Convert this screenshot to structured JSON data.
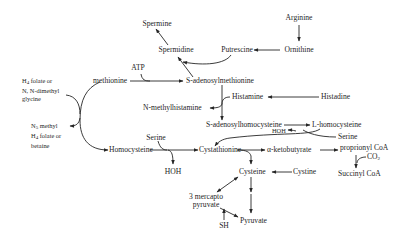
{
  "diagram": {
    "type": "metabolic-pathway",
    "nodes": {
      "arginine": "Arginine",
      "ornithine": "Ornithine",
      "putrescine": "Putrescine",
      "spermidine": "Spermidine",
      "spermine": "Spermine",
      "atp": "ATP",
      "methionine": "methionine",
      "sam": "S-adenosylmethionine",
      "h4folate_l1": "H",
      "h4folate_sub": "4",
      "h4folate_l1b": " folate or",
      "h4folate_l2": "N, N-dimethyl",
      "h4folate_l3": "glycine",
      "n5methyl_l1a": "N",
      "n5methyl_sub": "5",
      "n5methyl_l1b": " methyl",
      "n5methyl_l2a": "H",
      "n5methyl_l2sub": "4",
      "n5methyl_l2b": " folate or",
      "n5methyl_l3": "betaine",
      "n_methylhistamine": "N-methylhistamine",
      "histamine": "Histamine",
      "histadine": "Histadine",
      "sah": "S-adenosylhomocysteine",
      "l_homocysteine": "L-homocysteine",
      "hoh_top": "HOH",
      "serine_right": "Serine",
      "homocysteine": "Homocysteine",
      "serine_left": "Serine",
      "hoh_left": "HOH",
      "cystathionine": "Cystathionine",
      "alpha_ketobutyrate": "α-ketobutyrate",
      "proprionyl_coa": "proprionyl CoA",
      "co2": "CO",
      "co2_sub": "2",
      "succinyl_coa": "Succinyl CoA",
      "cysteine": "Cysteine",
      "cystine": "Cystine",
      "mercapto_l1": "3 mercapto",
      "mercapto_l2": "pyruvate",
      "sh": "SH",
      "pyruvate": "Pyruvate"
    },
    "edges": [
      [
        "Arginine",
        "Ornithine"
      ],
      [
        "Ornithine",
        "Putrescine"
      ],
      [
        "Putrescine",
        "Spermidine"
      ],
      [
        "S-adenosylmethionine",
        "Spermidine"
      ],
      [
        "Spermidine",
        "Spermine"
      ],
      [
        "methionine",
        "S-adenosylmethionine",
        "ATP"
      ],
      [
        "Histadine",
        "Histamine"
      ],
      [
        "S-adenosylmethionine",
        "S-adenosylhomocysteine",
        "Histamine -> N-methylhistamine"
      ],
      [
        "S-adenosylhomocysteine",
        "L-homocysteine"
      ],
      [
        "L-homocysteine",
        "Cystathionine",
        "Serine -> HOH"
      ],
      [
        "Homocysteine",
        "methionine",
        "N5 methyl H4 folate or betaine -> H4 folate or N,N-dimethyl glycine"
      ],
      [
        "Homocysteine",
        "Cystathionine",
        "Serine -> HOH"
      ],
      [
        "Cystathionine",
        "α-ketobutyrate"
      ],
      [
        "Cystathionine",
        "Cysteine"
      ],
      [
        "α-ketobutyrate",
        "proprionyl CoA"
      ],
      [
        "proprionyl CoA",
        "Succinyl CoA",
        "CO2"
      ],
      [
        "Cystine",
        "Cysteine"
      ],
      [
        "Cysteine",
        "Pyruvate"
      ],
      [
        "Cysteine",
        "3 mercapto pyruvate"
      ],
      [
        "3 mercapto pyruvate",
        "Pyruvate"
      ],
      [
        "3 mercapto pyruvate",
        "SH"
      ]
    ]
  },
  "colors": {
    "ink": "#262626",
    "background": "#ffffff"
  }
}
